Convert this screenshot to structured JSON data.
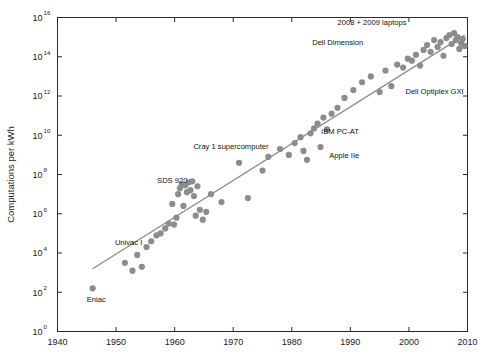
{
  "chart_data": {
    "type": "scatter",
    "title": "",
    "xlabel": "",
    "ylabel": "Computations per kWh",
    "xlim": [
      1940,
      2010
    ],
    "ylim": [
      0,
      16
    ],
    "y_scale": "log10",
    "grid": false,
    "legend": null,
    "x_ticks": [
      "1940",
      "1950",
      "1960",
      "1970",
      "1980",
      "1990",
      "2000",
      "2010"
    ],
    "x_tick_values": [
      1940,
      1950,
      1960,
      1970,
      1980,
      1990,
      2000,
      2010
    ],
    "y_ticks": [
      "10^0",
      "10^2",
      "10^4",
      "10^6",
      "10^8",
      "10^10",
      "10^12",
      "10^14",
      "10^16"
    ],
    "y_tick_bases": [
      "10",
      "10",
      "10",
      "10",
      "10",
      "10",
      "10",
      "10",
      "10"
    ],
    "y_tick_exponents": [
      "0",
      "2",
      "4",
      "6",
      "8",
      "10",
      "12",
      "14",
      "16"
    ],
    "y_tick_values": [
      0,
      2,
      4,
      6,
      8,
      10,
      12,
      14,
      16
    ],
    "series": [
      {
        "name": "computing efficiency",
        "marker": "circle",
        "color": "#8c8c8c",
        "points": [
          [
            1946.0,
            2.2
          ],
          [
            1951.5,
            3.5
          ],
          [
            1952.8,
            3.1
          ],
          [
            1953.6,
            3.9
          ],
          [
            1954.4,
            3.3
          ],
          [
            1955.2,
            4.3
          ],
          [
            1956.0,
            4.6
          ],
          [
            1956.9,
            4.9
          ],
          [
            1957.6,
            5.0
          ],
          [
            1958.4,
            5.25
          ],
          [
            1959.0,
            5.5
          ],
          [
            1959.6,
            6.5
          ],
          [
            1959.9,
            5.45
          ],
          [
            1960.3,
            5.8
          ],
          [
            1960.6,
            7.0
          ],
          [
            1960.9,
            7.3
          ],
          [
            1961.2,
            7.5
          ],
          [
            1961.5,
            6.4
          ],
          [
            1961.8,
            7.45
          ],
          [
            1962.1,
            7.1
          ],
          [
            1962.4,
            7.6
          ],
          [
            1962.7,
            7.2
          ],
          [
            1963.0,
            7.65
          ],
          [
            1963.3,
            6.9
          ],
          [
            1963.6,
            5.9
          ],
          [
            1963.9,
            7.4
          ],
          [
            1964.3,
            6.2
          ],
          [
            1964.8,
            5.7
          ],
          [
            1965.4,
            6.1
          ],
          [
            1966.2,
            7.0
          ],
          [
            1968.0,
            6.6
          ],
          [
            1971.0,
            8.6
          ],
          [
            1972.5,
            6.8
          ],
          [
            1975.0,
            8.2
          ],
          [
            1976.0,
            8.9
          ],
          [
            1978.0,
            9.3
          ],
          [
            1979.5,
            9.0
          ],
          [
            1980.5,
            9.6
          ],
          [
            1981.5,
            9.9
          ],
          [
            1982.0,
            9.2
          ],
          [
            1982.6,
            8.75
          ],
          [
            1983.2,
            10.1
          ],
          [
            1983.8,
            10.35
          ],
          [
            1984.4,
            10.6
          ],
          [
            1984.9,
            9.4
          ],
          [
            1985.4,
            10.9
          ],
          [
            1986.0,
            10.3
          ],
          [
            1986.8,
            11.1
          ],
          [
            1987.8,
            11.4
          ],
          [
            1989.0,
            11.9
          ],
          [
            1990.5,
            12.3
          ],
          [
            1992.0,
            12.7
          ],
          [
            1993.5,
            13.0
          ],
          [
            1995.0,
            12.2
          ],
          [
            1996.0,
            13.3
          ],
          [
            1997.0,
            12.5
          ],
          [
            1998.0,
            13.6
          ],
          [
            1999.0,
            13.45
          ],
          [
            1999.8,
            13.9
          ],
          [
            2000.5,
            13.8
          ],
          [
            2001.2,
            14.1
          ],
          [
            2001.9,
            13.55
          ],
          [
            2002.5,
            14.35
          ],
          [
            2003.1,
            14.6
          ],
          [
            2003.7,
            14.25
          ],
          [
            2004.3,
            14.85
          ],
          [
            2004.9,
            14.5
          ],
          [
            2005.4,
            14.75
          ],
          [
            2005.9,
            14.05
          ],
          [
            2006.4,
            14.95
          ],
          [
            2006.9,
            15.1
          ],
          [
            2007.3,
            14.65
          ],
          [
            2007.7,
            15.2
          ],
          [
            2008.0,
            14.85
          ],
          [
            2008.3,
            15.0
          ],
          [
            2008.6,
            14.4
          ],
          [
            2008.9,
            14.7
          ],
          [
            2009.2,
            14.9
          ],
          [
            2009.5,
            14.55
          ]
        ]
      }
    ],
    "trendline": {
      "name": "fit",
      "color": "#8c8c8c",
      "x_start": 1946.0,
      "y_start": 3.2,
      "x_end": 2009.5,
      "y_end": 15.1
    },
    "annotations": [
      {
        "label": "2008 + 2009 laptops",
        "x": 1999.6,
        "y": 15.62,
        "anchor": "end"
      },
      {
        "label": "Dell Dimension",
        "x": 1992.2,
        "y": 14.62,
        "anchor": "end"
      },
      {
        "label": "Dell Optiplex GXI",
        "x": 1999.4,
        "y": 12.08,
        "anchor": "start"
      },
      {
        "label": "IBM PC-AT",
        "x": 1985.0,
        "y": 10.05,
        "anchor": "start"
      },
      {
        "label": "Apple IIe",
        "x": 1986.4,
        "y": 8.85,
        "anchor": "start"
      },
      {
        "label": "Cray 1 supercomputer",
        "x": 1963.2,
        "y": 9.28,
        "anchor": "start"
      },
      {
        "label": "SDS 920",
        "x": 1957.0,
        "y": 7.55,
        "anchor": "start"
      },
      {
        "label": "Univac I",
        "x": 1949.8,
        "y": 4.42,
        "anchor": "start"
      },
      {
        "label": "Eniac",
        "x": 1945.0,
        "y": 1.52,
        "anchor": "start"
      }
    ]
  }
}
